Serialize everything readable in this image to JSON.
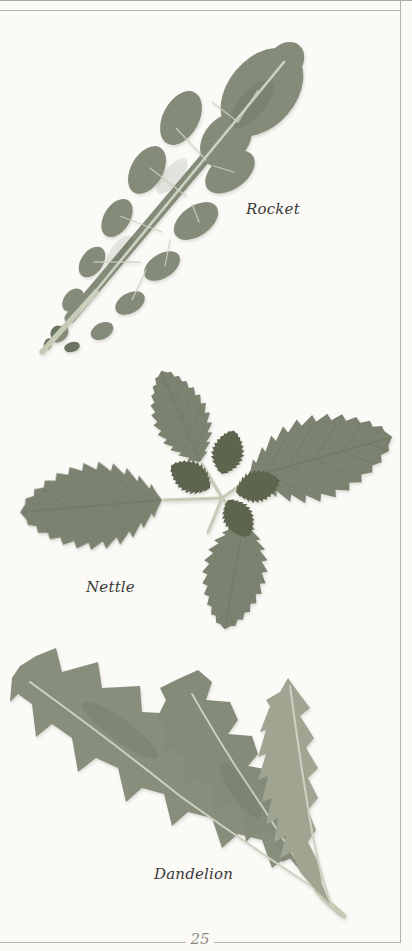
{
  "page": {
    "specimens": [
      {
        "id": "rocket",
        "label": "Rocket"
      },
      {
        "id": "nettle",
        "label": "Nettle"
      },
      {
        "id": "dandelion",
        "label": "Dandelion"
      }
    ],
    "footer": {
      "page_number": "25"
    }
  },
  "colors": {
    "page_background": "#fbfaf7",
    "frame_line": "#b3b3b0",
    "caption_text": "#3b3b39",
    "page_number_text": "#8a8a84",
    "rocket_leaf": "#848c79",
    "nettle_leaf": "#7b8370",
    "nettle_center_leaflets": "#5d654f",
    "dandelion_leaf_left": "#878e7b",
    "dandelion_leaf_middle": "#848b78",
    "dandelion_leaf_right": "#9fa591",
    "leaf_vein_light": "#cdd2c0",
    "stem_light": "#c6cbb7"
  }
}
